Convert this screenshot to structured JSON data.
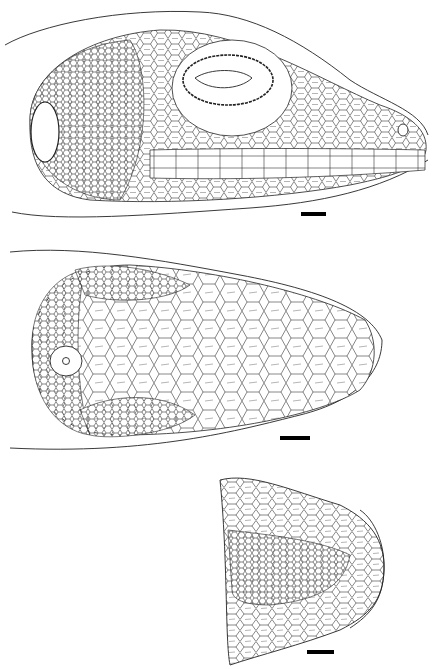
{
  "figure": {
    "panels": [
      {
        "id": "lateral",
        "view": "lateral view of head",
        "scale_bar": {
          "x": 301,
          "y": 212,
          "w": 25,
          "h": 4
        }
      },
      {
        "id": "dorsal",
        "view": "dorsal view of head",
        "scale_bar": {
          "x": 280,
          "y": 436,
          "w": 30,
          "h": 4
        }
      },
      {
        "id": "ventral",
        "view": "ventral view of chin",
        "scale_bar": {
          "x": 307,
          "y": 650,
          "w": 27,
          "h": 4
        }
      }
    ],
    "colors": {
      "ink": "#222222",
      "background": "#ffffff",
      "bar": "#000000"
    }
  }
}
